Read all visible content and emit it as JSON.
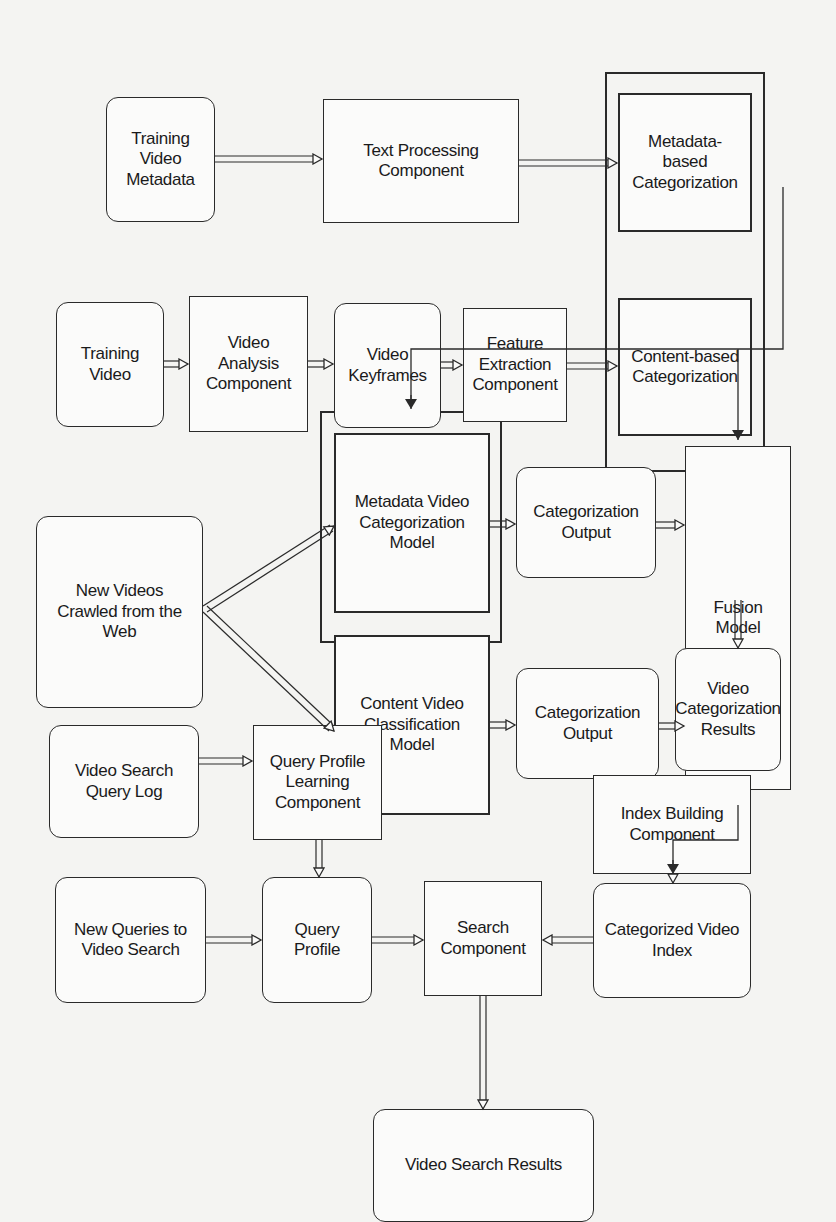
{
  "diagram": {
    "nodes": {
      "training_video_metadata": "Training\nVideo\nMetadata",
      "text_processing_component": "Text Processing\nComponent",
      "metadata_based_categorization": "Metadata-\nbased\nCategorization",
      "training_video": "Training\nVideo",
      "video_analysis_component": "Video\nAnalysis\nComponent",
      "video_keyframes": "Video\nKeyframes",
      "feature_extraction_component": "Feature\nExtraction\nComponent",
      "content_based_categorization": "Content-based\nCategorization",
      "new_videos_crawled": "New Videos\nCrawled from the\nWeb",
      "metadata_video_categorization_model": "Metadata Video\nCategorization\nModel",
      "content_video_classification_model": "Content Video\nClassification\nModel",
      "categorization_output_1": "Categorization\nOutput",
      "categorization_output_2": "Categorization\nOutput",
      "fusion_model": "Fusion\nModel",
      "video_categorization_results": "Video\nCategorization\nResults",
      "video_search_query_log": "Video Search\nQuery Log",
      "query_profile_learning_component": "Query Profile\nLearning\nComponent",
      "index_building_component": "Index Building\nComponent",
      "new_queries_to_video_search": "New Queries to\nVideo Search",
      "query_profile": "Query\nProfile",
      "search_component": "Search\nComponent",
      "categorized_video_index": "Categorized Video\nIndex",
      "video_search_results": "Video Search Results"
    },
    "edges": [
      [
        "training_video_metadata",
        "text_processing_component"
      ],
      [
        "text_processing_component",
        "metadata_based_categorization"
      ],
      [
        "training_video",
        "video_analysis_component"
      ],
      [
        "video_analysis_component",
        "video_keyframes"
      ],
      [
        "video_keyframes",
        "feature_extraction_component"
      ],
      [
        "feature_extraction_component",
        "content_based_categorization"
      ],
      [
        "categorization_training_group",
        "categorization_models_group"
      ],
      [
        "categorization_training_group",
        "fusion_model"
      ],
      [
        "new_videos_crawled",
        "metadata_video_categorization_model"
      ],
      [
        "new_videos_crawled",
        "content_video_classification_model"
      ],
      [
        "metadata_video_categorization_model",
        "categorization_output_1"
      ],
      [
        "content_video_classification_model",
        "categorization_output_2"
      ],
      [
        "categorization_output_1",
        "fusion_model"
      ],
      [
        "categorization_output_2",
        "fusion_model"
      ],
      [
        "fusion_model",
        "video_categorization_results"
      ],
      [
        "video_categorization_results",
        "index_building_component"
      ],
      [
        "index_building_component",
        "categorized_video_index"
      ],
      [
        "video_search_query_log",
        "query_profile_learning_component"
      ],
      [
        "query_profile_learning_component",
        "query_profile"
      ],
      [
        "new_queries_to_video_search",
        "query_profile"
      ],
      [
        "query_profile",
        "search_component"
      ],
      [
        "categorized_video_index",
        "search_component"
      ],
      [
        "search_component",
        "video_search_results"
      ]
    ]
  }
}
